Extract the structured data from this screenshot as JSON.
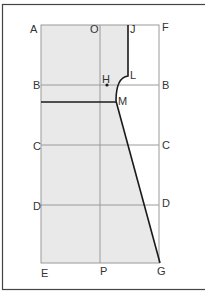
{
  "diagram": {
    "type": "pattern-drafting-diagram",
    "colors": {
      "frame": "#444444",
      "grid": "#9a9a9a",
      "fill": "#e9e9e9",
      "pattern_line": "#1a1a1a",
      "label": "#333333"
    },
    "labels": {
      "A": "A",
      "O": "O",
      "J": "J",
      "F": "F",
      "L": "L",
      "H": "H",
      "B_left": "B",
      "B_right": "B",
      "M": "M",
      "C_left": "C",
      "C_right": "C",
      "D_left": "D",
      "D_right": "D",
      "E": "E",
      "P": "P",
      "G": "G"
    },
    "grid_rows": [
      "A-F",
      "B-B",
      "C-C",
      "D-D",
      "E-G"
    ],
    "grid_columns": [
      "A-E",
      "O-P",
      "F-G"
    ]
  }
}
